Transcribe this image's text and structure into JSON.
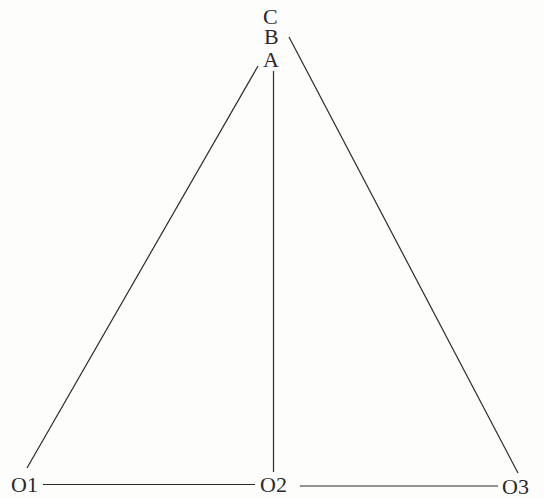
{
  "diagram": {
    "type": "geometry",
    "labels": {
      "C": "C",
      "B": "B",
      "A": "A",
      "O1": "O1",
      "O2": "O2",
      "O3": "O3"
    },
    "segments": [
      {
        "from": "O1",
        "to": "B"
      },
      {
        "from": "O2",
        "to": "A"
      },
      {
        "from": "O3",
        "to": "C"
      },
      {
        "from": "O1",
        "to": "O2"
      },
      {
        "from": "O2",
        "to": "O3"
      }
    ],
    "stroke_color": "#2a2a2a"
  }
}
